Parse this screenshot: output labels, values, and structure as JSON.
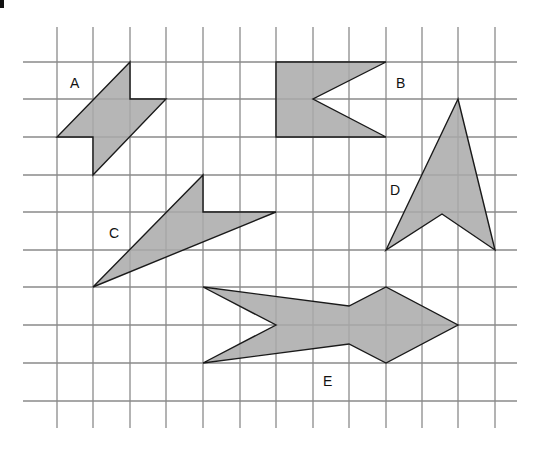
{
  "figure": {
    "type": "grid-shapes",
    "background": "#ffffff",
    "grid": {
      "color": "#8a8a8a",
      "columns_x": [
        57,
        93,
        130,
        166,
        203,
        240,
        276,
        313,
        349,
        386,
        422,
        458,
        495
      ],
      "rows_y": [
        62,
        99,
        137,
        175,
        212,
        250,
        287,
        325,
        363,
        401
      ],
      "vertical_extent": [
        27,
        428
      ],
      "horizontal_extent": [
        23,
        517
      ]
    },
    "shape_fill": "#a9a9a9",
    "shape_stroke": "#1a1a1a",
    "shapes": [
      {
        "label": "A",
        "label_pos": [
          70,
          76
        ],
        "points": [
          [
            130,
            62
          ],
          [
            130,
            99
          ],
          [
            166,
            99
          ],
          [
            93,
            175
          ],
          [
            93,
            137
          ],
          [
            57,
            137
          ]
        ]
      },
      {
        "label": "B",
        "label pos": [
          396,
          76
        ],
        "label_pos": [
          396,
          76
        ],
        "points": [
          [
            276,
            62
          ],
          [
            386,
            62
          ],
          [
            313,
            99
          ],
          [
            386,
            137
          ],
          [
            276,
            137
          ]
        ]
      },
      {
        "label": "C",
        "label_pos": [
          109,
          226
        ],
        "points": [
          [
            203,
            175
          ],
          [
            203,
            212
          ],
          [
            276,
            212
          ],
          [
            93,
            287
          ]
        ]
      },
      {
        "label": "D",
        "label_pos": [
          390,
          183
        ],
        "points": [
          [
            458,
            99
          ],
          [
            495,
            250
          ],
          [
            442,
            214
          ],
          [
            386,
            250
          ]
        ]
      },
      {
        "label": "E",
        "label_pos": [
          323,
          374
        ],
        "points": [
          [
            203,
            287
          ],
          [
            349,
            306
          ],
          [
            386,
            287
          ],
          [
            458,
            325
          ],
          [
            386,
            363
          ],
          [
            349,
            344
          ],
          [
            203,
            363
          ],
          [
            276,
            325
          ]
        ]
      }
    ]
  }
}
